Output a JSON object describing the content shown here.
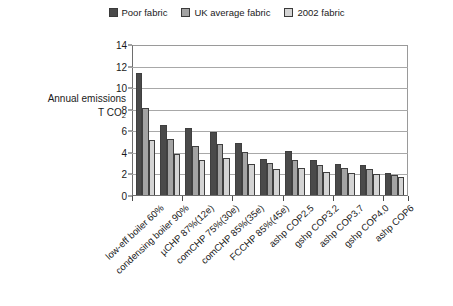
{
  "legend": {
    "position": "top-center",
    "entries": [
      {
        "label": "Poor fabric",
        "color": "#4a4a4a",
        "icon": "square-swatch-icon"
      },
      {
        "label": "UK average fabric",
        "color": "#a3a3a3",
        "icon": "square-swatch-icon"
      },
      {
        "label": "2002 fabric",
        "color": "#d4d4d4",
        "icon": "square-swatch-icon"
      }
    ]
  },
  "axis_title": {
    "line1": "Annual emissions",
    "line2": "T CO",
    "line2_sub": "2"
  },
  "yticks": [
    "0",
    "2",
    "4",
    "6",
    "8",
    "10",
    "12",
    "14"
  ],
  "chart_data": {
    "type": "bar",
    "title": "",
    "subtitle": "",
    "xlabel": "",
    "ylabel": "Annual emissions T CO2",
    "ylim": [
      0,
      14
    ],
    "ytick_step": 2,
    "grid": true,
    "legend_position": "top-center",
    "categories": [
      "low-eff boiler 60%",
      "condensing boiler 90%",
      "µCHP 87%(12e)",
      "comCHP 75%(30e)",
      "comCHP 85%(35e)",
      "FCCHP 85%(45e)",
      "ashp COP2.5",
      "gshp COP3.2",
      "ashp COP3.7",
      "gshp COP4.0",
      "ashp COP6"
    ],
    "series": [
      {
        "name": "Poor fabric",
        "color": "#4a4a4a",
        "values": [
          11.5,
          6.6,
          6.3,
          5.9,
          4.9,
          3.4,
          4.1,
          3.3,
          2.9,
          2.8,
          2.1
        ]
      },
      {
        "name": "UK average fabric",
        "color": "#a3a3a3",
        "values": [
          8.2,
          5.3,
          4.6,
          4.8,
          4.0,
          3.0,
          3.3,
          2.8,
          2.5,
          2.4,
          1.9
        ]
      },
      {
        "name": "2002 fabric",
        "color": "#d4d4d4",
        "values": [
          5.2,
          3.9,
          3.3,
          3.5,
          2.9,
          2.4,
          2.5,
          2.2,
          2.1,
          2.0,
          1.7
        ]
      }
    ]
  }
}
